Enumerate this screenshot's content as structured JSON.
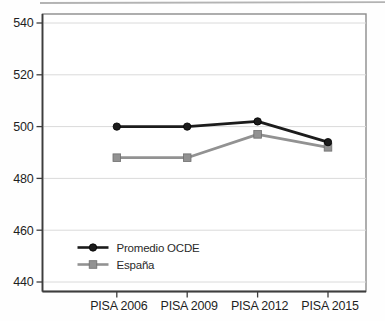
{
  "chart_data": {
    "type": "line",
    "title": "",
    "xlabel": "",
    "ylabel": "",
    "categories": [
      "PISA 2006",
      "PISA 2009",
      "PISA 2012",
      "PISA 2015"
    ],
    "series": [
      {
        "name": "Promedio OCDE",
        "marker": "circle",
        "color": "#1c1c1c",
        "marker_stroke": "#000000",
        "values": [
          500,
          500,
          502,
          494
        ]
      },
      {
        "name": "España",
        "marker": "square",
        "color": "#929292",
        "marker_stroke": "#6e6e6e",
        "values": [
          488,
          488,
          497,
          492
        ]
      }
    ],
    "ylim": [
      436,
      544
    ],
    "yticks": [
      440,
      460,
      480,
      500,
      520,
      540
    ],
    "grid": true,
    "legend_position": "inside-bottom-left"
  },
  "colors": {
    "plot_background": "#ffffff",
    "grid_line": "#dadada",
    "plot_border": "#8c8c8c",
    "axis_line": "#3d3d3d",
    "tick_text": "#1f1f1f",
    "legend_text": "#2a2a2a",
    "scan_edge": "#9b9b9b"
  }
}
